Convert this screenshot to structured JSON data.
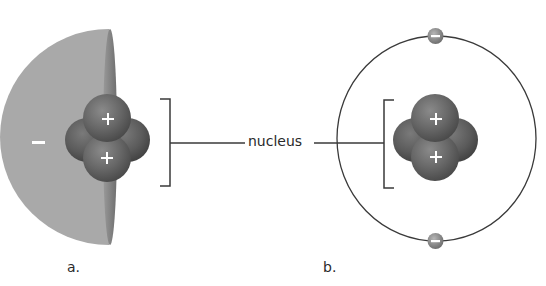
{
  "diagram": {
    "callout": {
      "text": "nucleus"
    },
    "panels": [
      {
        "id": "a",
        "label": "a.",
        "model": "electron-cloud hemisphere",
        "cloud_charge": "–",
        "nucleus": {
          "protons": [
            {
              "sign": "+"
            },
            {
              "sign": "+"
            }
          ],
          "neutrons": 2
        }
      },
      {
        "id": "b",
        "label": "b.",
        "model": "orbit with electrons",
        "electrons": [
          {
            "sign": "–"
          },
          {
            "sign": "–"
          }
        ],
        "nucleus": {
          "protons": [
            {
              "sign": "+"
            },
            {
              "sign": "+"
            }
          ],
          "neutrons": 2
        }
      }
    ],
    "colors": {
      "cloud": "#a9a9a9",
      "cloud_rim": "#7c7c7c",
      "particle": "#6a6a6a",
      "particle_dark": "#4a4a4a",
      "line": "#3a3a3a",
      "sign": "#ffffff"
    }
  }
}
